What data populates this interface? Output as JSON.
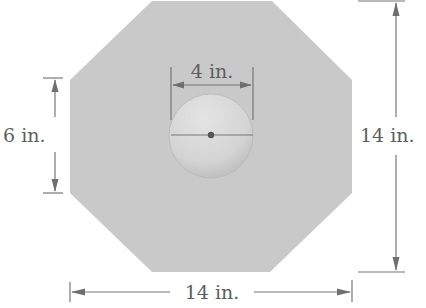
{
  "figure": {
    "shape": "octagon",
    "colors": {
      "octagon_fill": "#c9c9c9",
      "circle_fill": "#d6d6d6",
      "circle_edge": "#b4b4b4",
      "line": "#777777",
      "text": "#5e5e5e",
      "dot": "#555555"
    },
    "dimensions": {
      "circle_diameter": {
        "label": "4 in."
      },
      "side_length": {
        "label": "6 in."
      },
      "height": {
        "label": "14 in."
      },
      "width": {
        "label": "14 in."
      }
    }
  }
}
